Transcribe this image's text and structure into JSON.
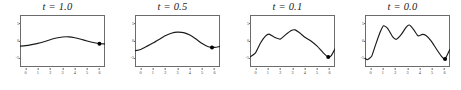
{
  "figure": {
    "background_color": "#ffffff",
    "line_color": "#1a1a1a",
    "marker_color": "#000000",
    "axis_color": "#6b6b6b",
    "panel_count": 4
  },
  "chart_data": [
    {
      "type": "line",
      "title": "t = 1.0",
      "xlabel": "",
      "ylabel": "",
      "grid": false,
      "legend": "none",
      "xlim": [
        -0.45,
        6.45
      ],
      "ylim": [
        -7.5,
        7.5
      ],
      "xticks": [
        0,
        1,
        2,
        3,
        4,
        5,
        6
      ],
      "xticklabels": [
        "0",
        "1",
        "2",
        "3",
        "4",
        "5",
        "6"
      ],
      "yticks": [
        -5,
        0,
        5
      ],
      "yticklabels": [
        "-5",
        "0",
        "5"
      ],
      "x": [
        -0.45,
        0,
        0.5,
        1,
        1.5,
        2,
        2.5,
        3,
        3.5,
        4,
        4.5,
        5,
        5.5,
        6,
        6.45
      ],
      "values": [
        -1.5,
        -1.35,
        -1.05,
        -0.7,
        -0.2,
        0.35,
        0.85,
        1.15,
        1.2,
        0.95,
        0.5,
        0.0,
        -0.45,
        -0.8,
        -0.85
      ],
      "markers": [
        {
          "x": 6,
          "y": -0.8
        }
      ]
    },
    {
      "type": "line",
      "title": "t = 0.5",
      "xlabel": "",
      "ylabel": "",
      "grid": false,
      "legend": "none",
      "xlim": [
        -0.45,
        6.45
      ],
      "ylim": [
        -7.5,
        7.5
      ],
      "xticks": [
        0,
        1,
        2,
        3,
        4,
        5,
        6
      ],
      "xticklabels": [
        "0",
        "1",
        "2",
        "3",
        "4",
        "5",
        "6"
      ],
      "yticks": [
        -5,
        0,
        5
      ],
      "yticklabels": [
        "-5",
        "0",
        "5"
      ],
      "x": [
        -0.45,
        0,
        0.5,
        1,
        1.5,
        2,
        2.5,
        3,
        3.5,
        4,
        4.5,
        5,
        5.5,
        6,
        6.45
      ],
      "values": [
        -2.8,
        -2.45,
        -1.55,
        -0.6,
        0.45,
        1.5,
        2.25,
        2.55,
        2.4,
        1.7,
        0.55,
        -0.75,
        -1.65,
        -1.85,
        -1.55
      ],
      "markers": [
        {
          "x": 5.8,
          "y": -1.85
        }
      ]
    },
    {
      "type": "line",
      "title": "t = 0.1",
      "xlabel": "",
      "ylabel": "",
      "grid": false,
      "legend": "none",
      "xlim": [
        -0.45,
        6.45
      ],
      "ylim": [
        -7.5,
        7.5
      ],
      "xticks": [
        0,
        1,
        2,
        3,
        4,
        5,
        6
      ],
      "xticklabels": [
        "0",
        "1",
        "2",
        "3",
        "4",
        "5",
        "6"
      ],
      "yticks": [
        -5,
        0,
        5
      ],
      "yticklabels": [
        "-5",
        "0",
        "5"
      ],
      "x": [
        -0.45,
        0,
        0.4,
        0.8,
        1.1,
        1.5,
        2.0,
        2.4,
        2.9,
        3.2,
        3.6,
        4.0,
        4.5,
        5.0,
        5.5,
        5.9,
        6.15,
        6.45
      ],
      "values": [
        -4.6,
        -3.4,
        -0.6,
        1.4,
        2.0,
        1.15,
        0.55,
        1.7,
        3.0,
        3.2,
        2.3,
        1.1,
        0.0,
        -1.5,
        -3.4,
        -4.6,
        -4.2,
        -2.3
      ],
      "markers": [
        {
          "x": 5.9,
          "y": -4.6
        }
      ]
    },
    {
      "type": "line",
      "title": "t = 0.0",
      "xlabel": "",
      "ylabel": "",
      "grid": false,
      "legend": "none",
      "xlim": [
        -0.45,
        6.45
      ],
      "ylim": [
        -7.5,
        7.5
      ],
      "xticks": [
        0,
        1,
        2,
        3,
        4,
        5,
        6
      ],
      "xticklabels": [
        "0",
        "1",
        "2",
        "3",
        "4",
        "5",
        "6"
      ],
      "yticks": [
        -5,
        0,
        5
      ],
      "yticklabels": [
        "-5",
        "0",
        "5"
      ],
      "x": [
        -0.45,
        -0.25,
        0.1,
        0.4,
        0.75,
        1.05,
        1.4,
        1.8,
        2.1,
        2.5,
        2.9,
        3.15,
        3.5,
        3.85,
        4.2,
        4.5,
        4.9,
        5.4,
        5.8,
        6.05,
        6.45
      ],
      "values": [
        -5.0,
        -5.4,
        -4.3,
        -1.2,
        2.3,
        4.4,
        3.6,
        1.2,
        0.5,
        1.9,
        4.0,
        4.6,
        3.3,
        1.5,
        1.9,
        1.6,
        0.1,
        -2.6,
        -4.6,
        -5.2,
        -2.4
      ],
      "markers": [
        {
          "x": 6.05,
          "y": -5.2
        }
      ]
    }
  ]
}
